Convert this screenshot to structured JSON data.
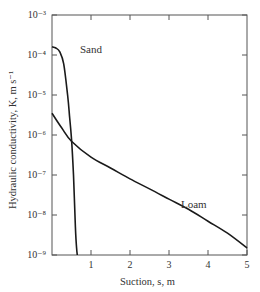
{
  "chart_data": {
    "type": "line",
    "title": "",
    "xlabel": "Suction, s, m",
    "ylabel": "Hydraulic conductivity, K, m s⁻¹",
    "xlim": [
      0,
      5
    ],
    "ylim": [
      1e-09,
      0.001
    ],
    "yscale": "log",
    "grid": false,
    "legend": "inline labels",
    "x_ticks": [
      1,
      2,
      3,
      4,
      5
    ],
    "x_tick_labels": [
      "1",
      "2",
      "3",
      "4",
      "5"
    ],
    "y_ticks": [
      1e-09,
      1e-08,
      1e-07,
      1e-06,
      1e-05,
      0.0001,
      0.001
    ],
    "y_tick_labels": [
      "10⁻⁹",
      "10⁻⁸",
      "10⁻⁷",
      "10⁻⁶",
      "10⁻⁵",
      "10⁻⁴",
      "10⁻³"
    ],
    "series": [
      {
        "name": "Sand",
        "x": [
          0.0,
          0.1,
          0.2,
          0.3,
          0.4,
          0.45,
          0.5,
          0.55,
          0.6,
          0.63,
          0.65
        ],
        "values": [
          0.00016,
          0.00015,
          0.00012,
          6e-05,
          1e-05,
          3e-06,
          8e-07,
          1e-07,
          5e-09,
          1.5e-09,
          1e-09
        ]
      },
      {
        "name": "Loam",
        "x": [
          0.0,
          0.25,
          0.5,
          1.0,
          1.5,
          2.0,
          2.5,
          3.0,
          3.5,
          4.0,
          4.5,
          5.0
        ],
        "values": [
          3.5e-06,
          1.5e-06,
          7e-07,
          2.8e-07,
          1.5e-07,
          8e-08,
          4.5e-08,
          2.5e-08,
          1.4e-08,
          7e-09,
          3.5e-09,
          1.5e-09
        ]
      }
    ]
  },
  "labels": {
    "sand": "Sand",
    "loam": "Loam",
    "xaxis": "Suction, s, m",
    "yaxis": "Hydraulic conductivity, K, m s⁻¹"
  }
}
